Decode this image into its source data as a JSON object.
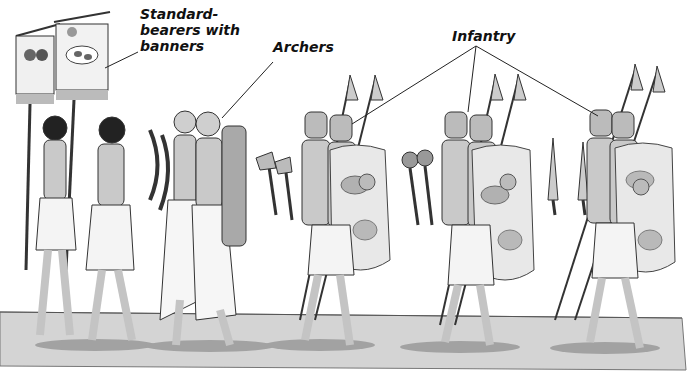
{
  "figure": {
    "labels": [
      {
        "id": "standard-bearers",
        "text_lines": [
          "Standard-",
          "bearers with",
          "banners"
        ],
        "x": 140,
        "y": 6
      },
      {
        "id": "archers",
        "text_lines": [
          "Archers"
        ],
        "x": 273,
        "y": 39
      },
      {
        "id": "infantry",
        "text_lines": [
          "Infantry"
        ],
        "x": 452,
        "y": 28
      }
    ],
    "groups": [
      {
        "name": "Standard-bearers",
        "count": 2,
        "carrying": "banners on poles"
      },
      {
        "name": "Archers",
        "count": 2,
        "carrying": "bows, quiver"
      },
      {
        "name": "Infantry (axe)",
        "count": 2,
        "carrying": "axes, spears, shields"
      },
      {
        "name": "Infantry (mace)",
        "count": 2,
        "carrying": "maces, spears, shields"
      },
      {
        "name": "Infantry (dagger)",
        "count": 2,
        "carrying": "daggers, spears, shields"
      }
    ],
    "colors": {
      "ground": "#d4d4d4",
      "ground_edge": "#7a7a7a",
      "skin": "#c9c9c9",
      "kilt": "#f4f4f4",
      "shield": "#e8e8e8",
      "shield_spot": "#9a9a9a",
      "outline": "#2a2a2a"
    }
  }
}
